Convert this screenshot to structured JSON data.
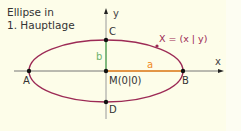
{
  "title": {
    "line1": "Ellipse in",
    "line2": "1. Hauptlage"
  },
  "axes": {
    "x_label": "x",
    "y_label": "y"
  },
  "points": {
    "A": "A",
    "B": "B",
    "C": "C",
    "D": "D",
    "M": "M(0|0)",
    "X": "X = (x | y)"
  },
  "segments": {
    "a": "a",
    "b": "b"
  },
  "colors": {
    "background": "#fdfde9",
    "ellipse": "#9c2a55",
    "axis": "#777777",
    "semi_major_a": "#f08a24",
    "semi_minor_b": "#6db36d",
    "point": "#111111"
  },
  "geometry": {
    "center": [
      106,
      71
    ],
    "rx": 77,
    "ry": 31
  }
}
